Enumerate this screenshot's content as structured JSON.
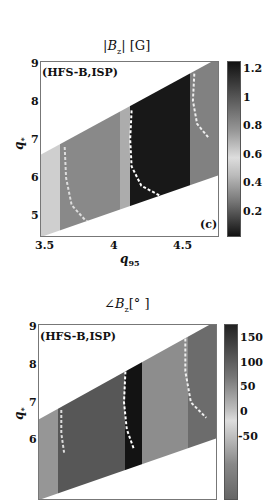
{
  "chart_data": [
    {
      "type": "heatmap",
      "title": "|B_z| [G]",
      "title_parts": {
        "prefix": "|",
        "symbol": "B",
        "sub": "z",
        "suffix": "| [G]"
      },
      "xlabel": "q_95",
      "ylabel": "q_*",
      "xlim": [
        3.48,
        4.75
      ],
      "ylim": [
        4.5,
        9
      ],
      "xticks": [
        "3.5",
        "4",
        "4.5"
      ],
      "yticks": [
        "5",
        "6",
        "7",
        "8",
        "9"
      ],
      "annotation": "(HFS-B,ISP)",
      "panel_label": "(c)",
      "colormap": "gray_reversed",
      "colorbar": {
        "range": [
          0.02,
          1.25
        ],
        "ticks": [
          "1.2",
          "1",
          "0.8",
          "0.6",
          "0.4",
          "0.2"
        ]
      },
      "valid_region": {
        "upper_boundary": [
          [
            3.5,
            6.65
          ],
          [
            4.7,
            9.0
          ]
        ],
        "lower_boundary": [
          [
            3.5,
            4.5
          ],
          [
            4.7,
            6.0
          ]
        ]
      },
      "bands_q95": [
        {
          "from": 3.48,
          "to": 3.62,
          "value": 0.15
        },
        {
          "from": 3.62,
          "to": 4.05,
          "value": 0.55
        },
        {
          "from": 4.05,
          "to": 4.12,
          "value": 0.35
        },
        {
          "from": 4.12,
          "to": 4.55,
          "value": 1.2
        },
        {
          "from": 4.55,
          "to": 4.75,
          "value": 0.6
        }
      ],
      "contours": [
        {
          "color": "#dddddd",
          "points": [
            [
              3.65,
              6.8
            ],
            [
              3.66,
              6.0
            ],
            [
              3.7,
              5.3
            ],
            [
              3.8,
              4.9
            ],
            [
              3.9,
              4.75
            ]
          ]
        },
        {
          "color": "#ffffff",
          "points": [
            [
              4.13,
              7.75
            ],
            [
              4.12,
              7.0
            ],
            [
              4.13,
              6.3
            ],
            [
              4.2,
              5.8
            ],
            [
              4.33,
              5.55
            ]
          ]
        },
        {
          "color": "#eeeeee",
          "points": [
            [
              4.58,
              8.7
            ],
            [
              4.57,
              8.0
            ],
            [
              4.6,
              7.4
            ],
            [
              4.68,
              7.05
            ]
          ]
        }
      ]
    },
    {
      "type": "heatmap",
      "title": "∠B_z[°]",
      "title_parts": {
        "prefix": "∠",
        "symbol": "B",
        "sub": "z",
        "suffix": "[° ]"
      },
      "xlabel": "q_95",
      "ylabel": "q_*",
      "xlim": [
        3.48,
        4.75
      ],
      "ylim": [
        4.5,
        9
      ],
      "yticks": [
        "6",
        "7",
        "8",
        "9"
      ],
      "annotation": "(HFS-B,ISP)",
      "colormap": "gray_reversed",
      "colorbar": {
        "range": [
          -75,
          180
        ],
        "ticks": [
          "150",
          "100",
          "50",
          "0",
          "-50"
        ]
      },
      "valid_region": {
        "upper_boundary": [
          [
            3.5,
            6.6
          ],
          [
            4.7,
            9.0
          ]
        ],
        "lower_boundary": [
          [
            3.5,
            4.5
          ],
          [
            4.7,
            6.0
          ]
        ]
      },
      "bands_q95": [
        {
          "from": 3.48,
          "to": 3.62,
          "value": 20
        },
        {
          "from": 3.62,
          "to": 4.1,
          "value": 95
        },
        {
          "from": 4.1,
          "to": 4.22,
          "value": 175
        },
        {
          "from": 4.22,
          "to": 4.55,
          "value": 30
        },
        {
          "from": 4.55,
          "to": 4.75,
          "value": 70
        }
      ],
      "contours": [
        {
          "color": "#dddddd",
          "points": [
            [
              3.64,
              6.8
            ],
            [
              3.64,
              6.2
            ],
            [
              3.66,
              5.7
            ]
          ]
        },
        {
          "color": "#ffffff",
          "points": [
            [
              4.1,
              7.8
            ],
            [
              4.09,
              7.0
            ],
            [
              4.11,
              6.3
            ],
            [
              4.16,
              5.8
            ]
          ]
        },
        {
          "color": "#eeeeee",
          "points": [
            [
              4.53,
              8.65
            ],
            [
              4.53,
              7.8
            ],
            [
              4.57,
              7.0
            ],
            [
              4.68,
              6.6
            ]
          ]
        }
      ]
    }
  ]
}
